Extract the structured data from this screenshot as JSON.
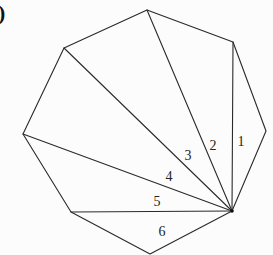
{
  "panel": {
    "label": ")"
  },
  "diagram": {
    "type": "polygon-triangulation",
    "stroke_color": "#2a2a2a",
    "vertices": [
      {
        "id": "top",
        "x": 147,
        "y": 10
      },
      {
        "id": "upper-right",
        "x": 233,
        "y": 42
      },
      {
        "id": "right",
        "x": 266,
        "y": 131
      },
      {
        "id": "hub",
        "x": 232,
        "y": 211
      },
      {
        "id": "bottom",
        "x": 150,
        "y": 254
      },
      {
        "id": "lower-left",
        "x": 71,
        "y": 212
      },
      {
        "id": "left",
        "x": 23,
        "y": 134
      },
      {
        "id": "upper-left",
        "x": 64,
        "y": 48
      }
    ],
    "diagonals_from_hub": [
      "upper-right",
      "top",
      "upper-left",
      "left",
      "lower-left"
    ],
    "triangles": [
      {
        "label": "1",
        "x": 241,
        "y": 146
      },
      {
        "label": "2",
        "x": 213,
        "y": 150
      },
      {
        "label": "3",
        "x": 188,
        "y": 160
      },
      {
        "label": "4",
        "x": 169,
        "y": 181
      },
      {
        "label": "5",
        "x": 157,
        "y": 206
      },
      {
        "label": "6",
        "x": 162,
        "y": 236
      }
    ]
  }
}
